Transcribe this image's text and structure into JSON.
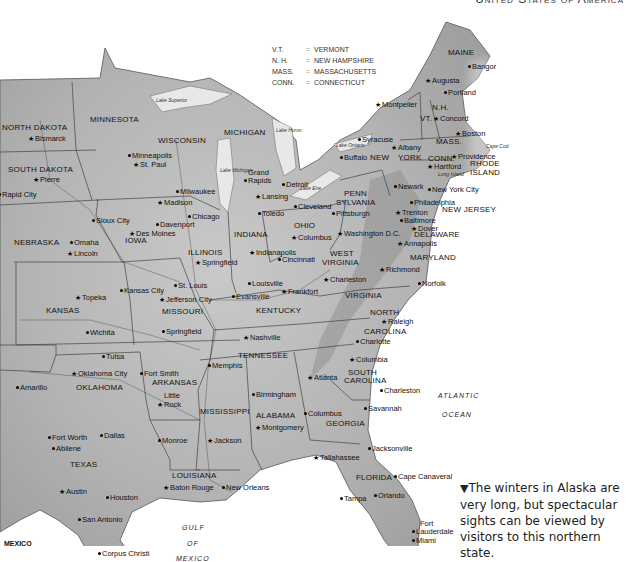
{
  "page": {
    "header": "United States of America"
  },
  "legend": {
    "rows": [
      {
        "abbr": "V.T.",
        "eq": "=",
        "name": "VERMONT"
      },
      {
        "abbr": "N. H.",
        "eq": "=",
        "name": "NEW HAMPSHIRE"
      },
      {
        "abbr": "MASS.",
        "eq": "=",
        "name": "MASSACHUSETTS"
      },
      {
        "abbr": "CONN.",
        "eq": "=",
        "name": "CONNECTICUT"
      }
    ]
  },
  "states": [
    {
      "name": "NORTH DAKOTA",
      "x": 2,
      "y": 124
    },
    {
      "name": "SOUTH DAKOTA",
      "x": 8,
      "y": 166
    },
    {
      "name": "MINNESOTA",
      "x": 90,
      "y": 116
    },
    {
      "name": "WISCONSIN",
      "x": 158,
      "y": 137
    },
    {
      "name": "MICHIGAN",
      "x": 224,
      "y": 129
    },
    {
      "name": "NEBRASKA",
      "x": 14,
      "y": 239
    },
    {
      "name": "IOWA",
      "x": 125,
      "y": 237
    },
    {
      "name": "ILLINOIS",
      "x": 188,
      "y": 249
    },
    {
      "name": "INDIANA",
      "x": 234,
      "y": 231
    },
    {
      "name": "OHIO",
      "x": 294,
      "y": 222
    },
    {
      "name": "PENN",
      "x": 344,
      "y": 190
    },
    {
      "name": "SYLVANIA",
      "x": 336,
      "y": 199
    },
    {
      "name": "NEW",
      "x": 370,
      "y": 154
    },
    {
      "name": "YORK",
      "x": 398,
      "y": 154
    },
    {
      "name": "MAINE",
      "x": 448,
      "y": 49
    },
    {
      "name": "VT.",
      "x": 420,
      "y": 115
    },
    {
      "name": "N.H.",
      "x": 432,
      "y": 104
    },
    {
      "name": "MASS.",
      "x": 436,
      "y": 138
    },
    {
      "name": "CONN.",
      "x": 428,
      "y": 155
    },
    {
      "name": "RHODE",
      "x": 470,
      "y": 160
    },
    {
      "name": "ISLAND",
      "x": 470,
      "y": 169
    },
    {
      "name": "NEW JERSEY",
      "x": 442,
      "y": 206
    },
    {
      "name": "DELAWARE",
      "x": 414,
      "y": 231
    },
    {
      "name": "MARYLAND",
      "x": 410,
      "y": 254
    },
    {
      "name": "WEST",
      "x": 330,
      "y": 250
    },
    {
      "name": "VIRGINIA",
      "x": 322,
      "y": 259
    },
    {
      "name": "VIRGINIA",
      "x": 345,
      "y": 292
    },
    {
      "name": "KANSAS",
      "x": 46,
      "y": 307
    },
    {
      "name": "MISSOURI",
      "x": 162,
      "y": 308
    },
    {
      "name": "KENTUCKY",
      "x": 256,
      "y": 307
    },
    {
      "name": "NORTH",
      "x": 370,
      "y": 309
    },
    {
      "name": "CAROLINA",
      "x": 364,
      "y": 328
    },
    {
      "name": "TENNESSEE",
      "x": 238,
      "y": 352
    },
    {
      "name": "OKLAHOMA",
      "x": 76,
      "y": 384
    },
    {
      "name": "ARKANSAS",
      "x": 152,
      "y": 379
    },
    {
      "name": "SOUTH",
      "x": 348,
      "y": 369
    },
    {
      "name": "CAROLINA",
      "x": 344,
      "y": 377
    },
    {
      "name": "MISSISSIPPI",
      "x": 200,
      "y": 408
    },
    {
      "name": "ALABAMA",
      "x": 256,
      "y": 412
    },
    {
      "name": "GEORGIA",
      "x": 326,
      "y": 420
    },
    {
      "name": "TEXAS",
      "x": 70,
      "y": 461
    },
    {
      "name": "LOUISIANA",
      "x": 172,
      "y": 472
    },
    {
      "name": "FLORIDA",
      "x": 356,
      "y": 474
    }
  ],
  "cities": [
    {
      "name": "Bismarck",
      "x": 35,
      "y": 135,
      "mark": "star"
    },
    {
      "name": "Pierre",
      "x": 40,
      "y": 176,
      "mark": "star"
    },
    {
      "name": "Rapid City",
      "x": 2,
      "y": 191,
      "mark": "dot"
    },
    {
      "name": "Minneapolis",
      "x": 132,
      "y": 152,
      "mark": "dot"
    },
    {
      "name": "St. Paul",
      "x": 140,
      "y": 161,
      "mark": "star"
    },
    {
      "name": "Milwaukee",
      "x": 180,
      "y": 188,
      "mark": "dot"
    },
    {
      "name": "Madison",
      "x": 164,
      "y": 199,
      "mark": "star"
    },
    {
      "name": "Grand",
      "x": 248,
      "y": 169,
      "mark": "none"
    },
    {
      "name": "Rapids",
      "x": 248,
      "y": 177,
      "mark": "dot"
    },
    {
      "name": "Lansing",
      "x": 262,
      "y": 193,
      "mark": "star"
    },
    {
      "name": "Detroit",
      "x": 286,
      "y": 181,
      "mark": "dot"
    },
    {
      "name": "Toledo",
      "x": 262,
      "y": 210,
      "mark": "dot"
    },
    {
      "name": "Cleveland",
      "x": 298,
      "y": 203,
      "mark": "dot"
    },
    {
      "name": "Buffalo",
      "x": 344,
      "y": 154,
      "mark": "dot"
    },
    {
      "name": "Syracuse",
      "x": 362,
      "y": 136,
      "mark": "dot"
    },
    {
      "name": "Albany",
      "x": 398,
      "y": 144,
      "mark": "star"
    },
    {
      "name": "Montpelier",
      "x": 382,
      "y": 101,
      "mark": "star"
    },
    {
      "name": "Concord",
      "x": 440,
      "y": 115,
      "mark": "star"
    },
    {
      "name": "Augusta",
      "x": 432,
      "y": 77,
      "mark": "star"
    },
    {
      "name": "Portland",
      "x": 448,
      "y": 89,
      "mark": "dot"
    },
    {
      "name": "Bangor",
      "x": 472,
      "y": 63,
      "mark": "dot"
    },
    {
      "name": "Boston",
      "x": 462,
      "y": 130,
      "mark": "star"
    },
    {
      "name": "Providence",
      "x": 458,
      "y": 153,
      "mark": "star"
    },
    {
      "name": "Hartford",
      "x": 434,
      "y": 163,
      "mark": "star"
    },
    {
      "name": "Newark",
      "x": 398,
      "y": 183,
      "mark": "dot"
    },
    {
      "name": "New York City",
      "x": 432,
      "y": 186,
      "mark": "dot"
    },
    {
      "name": "Philadelphia",
      "x": 414,
      "y": 199,
      "mark": "dot"
    },
    {
      "name": "Trenton",
      "x": 402,
      "y": 209,
      "mark": "star"
    },
    {
      "name": "Baltimore",
      "x": 404,
      "y": 217,
      "mark": "dot"
    },
    {
      "name": "Dover",
      "x": 418,
      "y": 225,
      "mark": "star"
    },
    {
      "name": "Annapolis",
      "x": 404,
      "y": 240,
      "mark": "star"
    },
    {
      "name": "Washington D.C.",
      "x": 344,
      "y": 230,
      "mark": "star"
    },
    {
      "name": "Pittsburgh",
      "x": 336,
      "y": 210,
      "mark": "dot"
    },
    {
      "name": "Richmond",
      "x": 386,
      "y": 266,
      "mark": "star"
    },
    {
      "name": "Norfolk",
      "x": 422,
      "y": 280,
      "mark": "dot"
    },
    {
      "name": "Charleston",
      "x": 330,
      "y": 276,
      "mark": "star"
    },
    {
      "name": "Columbus",
      "x": 298,
      "y": 234,
      "mark": "star"
    },
    {
      "name": "Cincinnati",
      "x": 282,
      "y": 256,
      "mark": "dot"
    },
    {
      "name": "Indianapolis",
      "x": 256,
      "y": 249,
      "mark": "star"
    },
    {
      "name": "Louisville",
      "x": 252,
      "y": 280,
      "mark": "dot"
    },
    {
      "name": "Frankfort",
      "x": 288,
      "y": 288,
      "mark": "star"
    },
    {
      "name": "Evansville",
      "x": 236,
      "y": 293,
      "mark": "dot"
    },
    {
      "name": "Chicago",
      "x": 192,
      "y": 213,
      "mark": "dot"
    },
    {
      "name": "Springfield",
      "x": 202,
      "y": 259,
      "mark": "star"
    },
    {
      "name": "Davenport",
      "x": 160,
      "y": 221,
      "mark": "dot"
    },
    {
      "name": "Des Moines",
      "x": 136,
      "y": 230,
      "mark": "star"
    },
    {
      "name": "Sioux City",
      "x": 96,
      "y": 217,
      "mark": "dot"
    },
    {
      "name": "Omaha",
      "x": 74,
      "y": 239,
      "mark": "dot"
    },
    {
      "name": "Lincoln",
      "x": 74,
      "y": 250,
      "mark": "star"
    },
    {
      "name": "St. Louis",
      "x": 178,
      "y": 282,
      "mark": "dot"
    },
    {
      "name": "Jefferson City",
      "x": 166,
      "y": 296,
      "mark": "star"
    },
    {
      "name": "Kansas City",
      "x": 124,
      "y": 287,
      "mark": "dot"
    },
    {
      "name": "Topeka",
      "x": 82,
      "y": 294,
      "mark": "star"
    },
    {
      "name": "Wichita",
      "x": 90,
      "y": 329,
      "mark": "dot"
    },
    {
      "name": "Springfield",
      "x": 166,
      "y": 328,
      "mark": "dot"
    },
    {
      "name": "Nashville",
      "x": 250,
      "y": 334,
      "mark": "star"
    },
    {
      "name": "Charlotte",
      "x": 360,
      "y": 338,
      "mark": "dot"
    },
    {
      "name": "Raleigh",
      "x": 388,
      "y": 318,
      "mark": "star"
    },
    {
      "name": "Columbia",
      "x": 356,
      "y": 356,
      "mark": "star"
    },
    {
      "name": "Tulsa",
      "x": 106,
      "y": 353,
      "mark": "dot"
    },
    {
      "name": "Oklahoma City",
      "x": 78,
      "y": 370,
      "mark": "star"
    },
    {
      "name": "Fort Smith",
      "x": 144,
      "y": 370,
      "mark": "dot"
    },
    {
      "name": "Memphis",
      "x": 212,
      "y": 362,
      "mark": "dot"
    },
    {
      "name": "Little",
      "x": 164,
      "y": 392,
      "mark": "none"
    },
    {
      "name": "Rock",
      "x": 164,
      "y": 401,
      "mark": "star"
    },
    {
      "name": "Atlanta",
      "x": 314,
      "y": 374,
      "mark": "star"
    },
    {
      "name": "Birmingham",
      "x": 256,
      "y": 391,
      "mark": "dot"
    },
    {
      "name": "Montgomery",
      "x": 262,
      "y": 424,
      "mark": "star"
    },
    {
      "name": "Columbus",
      "x": 308,
      "y": 410,
      "mark": "dot"
    },
    {
      "name": "Charleston",
      "x": 384,
      "y": 387,
      "mark": "dot"
    },
    {
      "name": "Savannah",
      "x": 368,
      "y": 405,
      "mark": "dot"
    },
    {
      "name": "Amarillo",
      "x": 20,
      "y": 384,
      "mark": "dot"
    },
    {
      "name": "Monroe",
      "x": 162,
      "y": 437,
      "mark": "dot"
    },
    {
      "name": "Jackson",
      "x": 214,
      "y": 437,
      "mark": "star"
    },
    {
      "name": "Fort Worth",
      "x": 52,
      "y": 434,
      "mark": "dot"
    },
    {
      "name": "Dallas",
      "x": 104,
      "y": 432,
      "mark": "dot"
    },
    {
      "name": "Abilene",
      "x": 56,
      "y": 445,
      "mark": "dot"
    },
    {
      "name": "Jacksonville",
      "x": 372,
      "y": 445,
      "mark": "dot"
    },
    {
      "name": "Tallahassee",
      "x": 320,
      "y": 454,
      "mark": "star"
    },
    {
      "name": "Cape Canaveral",
      "x": 398,
      "y": 473,
      "mark": "dot"
    },
    {
      "name": "Baton Rouge",
      "x": 170,
      "y": 484,
      "mark": "star"
    },
    {
      "name": "New Orleans",
      "x": 226,
      "y": 484,
      "mark": "dot"
    },
    {
      "name": "Austin",
      "x": 66,
      "y": 488,
      "mark": "star"
    },
    {
      "name": "Houston",
      "x": 110,
      "y": 494,
      "mark": "dot"
    },
    {
      "name": "Tampa",
      "x": 344,
      "y": 495,
      "mark": "dot"
    },
    {
      "name": "Orlando",
      "x": 378,
      "y": 492,
      "mark": "dot"
    },
    {
      "name": "San Antonio",
      "x": 82,
      "y": 516,
      "mark": "dot"
    },
    {
      "name": "Fort",
      "x": 420,
      "y": 520,
      "mark": "none"
    },
    {
      "name": "Lauderdale",
      "x": 416,
      "y": 528,
      "mark": "dot"
    },
    {
      "name": "Miami",
      "x": 416,
      "y": 537,
      "mark": "dot"
    },
    {
      "name": "Corpus Christi",
      "x": 102,
      "y": 550,
      "mark": "dot"
    }
  ],
  "water_labels": [
    {
      "name": "ATLANTIC",
      "x": 438,
      "y": 392
    },
    {
      "name": "OCEAN",
      "x": 442,
      "y": 411
    },
    {
      "name": "GULF",
      "x": 182,
      "y": 524
    },
    {
      "name": "OF",
      "x": 187,
      "y": 540
    },
    {
      "name": "MEXICO",
      "x": 176,
      "y": 555
    }
  ],
  "lakes": [
    {
      "name": "Lake Superior",
      "x": 156,
      "y": 98
    },
    {
      "name": "Lake Michigan",
      "x": 220,
      "y": 168
    },
    {
      "name": "Lake Huron",
      "x": 276,
      "y": 128
    },
    {
      "name": "Lake Erie",
      "x": 300,
      "y": 186
    },
    {
      "name": "Lake Ontario",
      "x": 336,
      "y": 143
    },
    {
      "name": "Long Island",
      "x": 438,
      "y": 172
    },
    {
      "name": "Cape Cod",
      "x": 486,
      "y": 144
    }
  ],
  "countries": [
    {
      "name": "MEXICO",
      "x": 4,
      "y": 540
    }
  ],
  "caption": {
    "marker": "▼",
    "text": "The winters in Alaska are very long, but spectacular sights can be viewed by visitors to this northern state."
  }
}
